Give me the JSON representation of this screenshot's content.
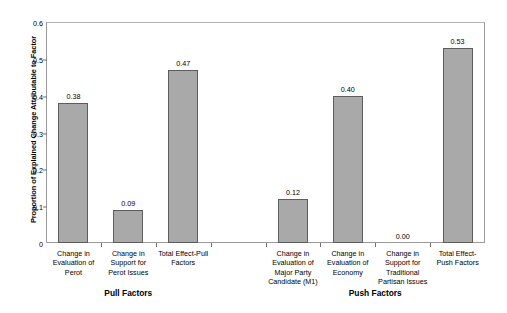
{
  "chart_data": {
    "type": "bar",
    "title": "",
    "xlabel": "",
    "ylabel": "Proportion of Explained Change Attributable to Factor",
    "ylim": [
      0,
      0.6
    ],
    "ytick_labels": [
      "0.6",
      "0.5",
      "0.4",
      "0.3",
      "0.2",
      "0.1",
      "0"
    ],
    "ytick_values": [
      0.6,
      0.5,
      0.4,
      0.3,
      0.2,
      0.1,
      0
    ],
    "grid": false,
    "legend": "none",
    "categories": [
      "Change in\nEvaluation of\nPerot",
      "Change in\nSupport for\nPerot Issues",
      "Total Effect-Pull\nFactors",
      "",
      "Change in\nEvaluation of\nMajor Party\nCandidate (M1)",
      "Change in\nEvaluation of\nEconomy",
      "Change in\nSupport for\nTraditional\nPartisan Issues",
      "Total Effect-\nPush Factors"
    ],
    "values": [
      0.38,
      0.09,
      0.47,
      null,
      0.12,
      0.4,
      0.0,
      0.53
    ],
    "value_labels": [
      "0.38",
      "0.09",
      "0.47",
      "",
      "0.12",
      "0.40",
      "0.00",
      "0.53"
    ],
    "groups": [
      {
        "label": "Pull Factors",
        "slots": [
          0,
          1,
          2
        ]
      },
      {
        "label": "Push Factors",
        "slots": [
          4,
          5,
          6,
          7
        ]
      }
    ],
    "colors": {
      "bar_fill": "#a9a9a9",
      "bar_border": "#5d5d5d",
      "axis": "#6f6f6f",
      "text": "#000000",
      "background": "#ffffff"
    }
  }
}
